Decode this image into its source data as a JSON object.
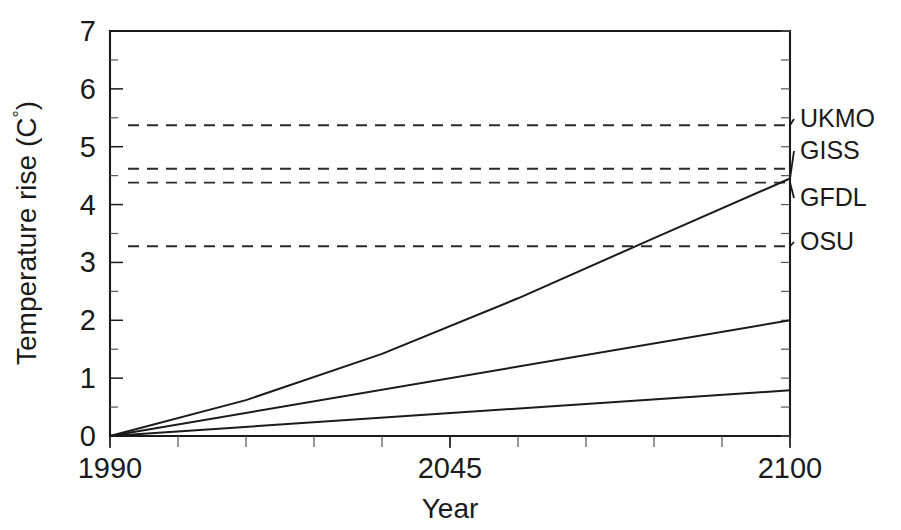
{
  "chart_data": {
    "type": "line",
    "title": "",
    "xlabel": "Year",
    "ylabel": "Temperature rise (C°)",
    "xlim": [
      1990,
      2100
    ],
    "ylim": [
      0,
      7
    ],
    "grid": false,
    "legend_position": "right-outside",
    "x_ticks": [
      {
        "value": 1990,
        "label": "1990"
      },
      {
        "value": 2045,
        "label": "2045"
      },
      {
        "value": 2100,
        "label": "2100"
      }
    ],
    "x_minor_tick_values": [
      1990,
      2001,
      2012,
      2023,
      2034,
      2045,
      2056,
      2067,
      2078,
      2089,
      2100
    ],
    "y_ticks": [
      {
        "value": 0,
        "label": "0"
      },
      {
        "value": 1,
        "label": "1"
      },
      {
        "value": 2,
        "label": "2"
      },
      {
        "value": 3,
        "label": "3"
      },
      {
        "value": 4,
        "label": "4"
      },
      {
        "value": 5,
        "label": "5"
      },
      {
        "value": 6,
        "label": "6"
      },
      {
        "value": 7,
        "label": "7"
      }
    ],
    "y_minor_tick_values": [
      0.5,
      1.5,
      2.5,
      3.5,
      4.5,
      5.5,
      6.5
    ],
    "series": [
      {
        "name": "GISS",
        "style": "solid",
        "x": [
          1990,
          2012,
          2034,
          2056,
          2078,
          2100
        ],
        "values": [
          0.0,
          0.62,
          1.42,
          2.38,
          3.42,
          4.45
        ]
      },
      {
        "name": "GFDL",
        "style": "solid",
        "x": [
          1990,
          2100
        ],
        "values": [
          0.0,
          2.0
        ]
      },
      {
        "name": "OSU",
        "style": "solid",
        "x": [
          1990,
          2100
        ],
        "values": [
          0.0,
          0.79
        ]
      }
    ],
    "reference_lines": [
      {
        "name": "UKMO",
        "value": 5.37,
        "style": "dashed"
      },
      {
        "name": "GISS",
        "value": 4.62,
        "style": "dashed"
      },
      {
        "name": "GFDL",
        "value": 4.38,
        "style": "dashed"
      },
      {
        "name": "OSU",
        "value": 3.28,
        "style": "dashed"
      }
    ],
    "legend_entries": [
      {
        "label": "UKMO",
        "target_value": 5.37
      },
      {
        "label": "GISS",
        "target_value": 4.45
      },
      {
        "label": "GFDL",
        "target_value": 4.38
      },
      {
        "label": "OSU",
        "target_value": 3.28
      }
    ],
    "colors": {
      "axis": "#1a1a1a",
      "series": "#1a1a1a",
      "reference": "#2a2a2a",
      "background": "#ffffff"
    }
  },
  "labels": {
    "y_axis_title_main": "Temperature rise (C",
    "y_axis_title_degree": "°",
    "y_axis_title_close": ")",
    "x_axis_title": "Year"
  }
}
